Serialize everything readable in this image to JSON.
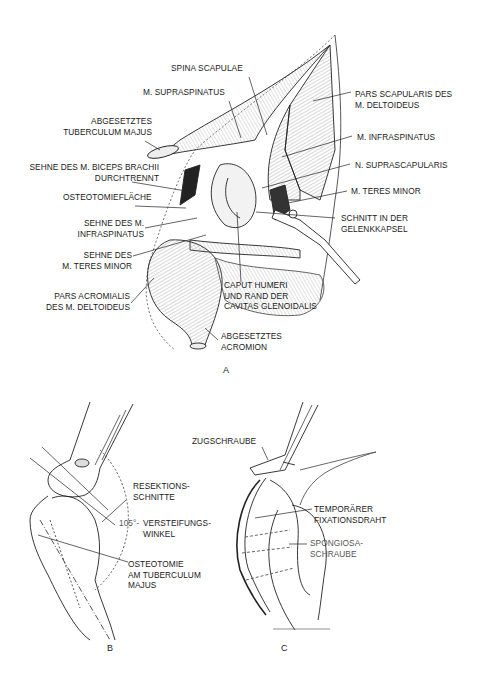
{
  "figure": {
    "panels": [
      {
        "id": "A",
        "letter": "A"
      },
      {
        "id": "B",
        "letter": "B"
      },
      {
        "id": "C",
        "letter": "C"
      }
    ]
  },
  "panel_a": {
    "labels": {
      "spina_scapulae": "SPINA SCAPULAE",
      "m_supraspinatus": "M. SUPRASPINATUS",
      "pars_scapularis": "PARS SCAPULARIS DES\nM. DELTOIDEUS",
      "abgesetztes_tuberculum": "ABGESETZTES\nTUBERCULUM MAJUS",
      "m_infraspinatus": "M. INFRASPINATUS",
      "sehne_biceps": "SEHNE DES M. BICEPS BRACHII\nDURCHTRENNT",
      "n_suprascapularis": "N. SUPRASCAPULARIS",
      "osteotomieflaeche": "OSTEOTOMIEFLÄCHE",
      "m_teres_minor": "M. TERES MINOR",
      "sehne_infraspinatus": "SEHNE DES M.\nINFRASPINATUS",
      "schnitt_gelenkkapsel": "SCHNITT IN DER\nGELENKKAPSEL",
      "sehne_teres_minor": "SEHNE DES\nM. TERES MINOR",
      "pars_acromialis": "PARS ACROMIALIS\nDES M. DELTOIDEUS",
      "caput_humeri": "CAPUT HUMERI\nUND RAND DER\nCAVITAS GLENOIDALIS",
      "abgesetztes_acromion": "ABGESETZTES\nACROMION"
    }
  },
  "panel_b": {
    "labels": {
      "resektionsschnitte": "RESEKTIONS-\nSCHNITTE",
      "angle": "105°-",
      "versteifungswinkel": "VERSTEIFUNGS-\nWINKEL",
      "osteotomie": "OSTEOTOMIE\nAM TUBERCULUM\nMAJUS"
    }
  },
  "panel_c": {
    "labels": {
      "zugschraube": "ZUGSCHRAUBE",
      "fixationsdraht": "TEMPORÄRER\nFIXATIONSDRAHT",
      "spongiosaschraube": "SPONGIOSA-\nSCHRAUBE"
    }
  }
}
